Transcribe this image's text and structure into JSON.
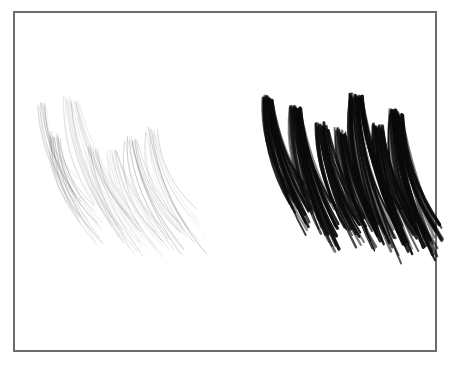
{
  "figure": {
    "title": "",
    "background_color": "#ffffff",
    "width": 452,
    "height": 365,
    "frame": {
      "label": "plot-border",
      "x": 14,
      "y": 12,
      "width": 422,
      "height": 339,
      "stroke_color": "#6b6b6b",
      "stroke_width": 1.4
    }
  },
  "chart_data": {
    "type": "scatter",
    "title": "",
    "subtitle": "",
    "xlabel": "",
    "ylabel": "",
    "xlim": [
      14,
      436
    ],
    "ylim": [
      12,
      351
    ],
    "grid": false,
    "legend": "none",
    "annotations": [],
    "tick_labels": {
      "x": [],
      "y": []
    },
    "series": [
      {
        "name": "left-cluster",
        "render": "stroke-bundles",
        "ink_color": "#5a5a5a",
        "ink_opacity": 0.55,
        "line_width": 0.55,
        "bounds": {
          "x0": 36,
          "y0": 98,
          "x1": 190,
          "y1": 286
        },
        "bundles": [
          {
            "id": "L1",
            "x": 42,
            "y": 106,
            "len": 108,
            "tilt": 20,
            "bow": 16,
            "count": 14,
            "spread": 9,
            "weight": 0.62,
            "fan": 7
          },
          {
            "id": "L2",
            "x": 55,
            "y": 136,
            "len": 112,
            "tilt": 23,
            "bow": 18,
            "count": 16,
            "spread": 11,
            "weight": 0.7,
            "fan": 9
          },
          {
            "id": "L3",
            "x": 71,
            "y": 100,
            "len": 150,
            "tilt": 22,
            "bow": 20,
            "count": 18,
            "spread": 14,
            "weight": 0.55,
            "fan": 11
          },
          {
            "id": "L4",
            "x": 92,
            "y": 150,
            "len": 118,
            "tilt": 25,
            "bow": 17,
            "count": 15,
            "spread": 12,
            "weight": 0.58,
            "fan": 9
          },
          {
            "id": "L5",
            "x": 112,
            "y": 152,
            "len": 120,
            "tilt": 26,
            "bow": 16,
            "count": 13,
            "spread": 11,
            "weight": 0.52,
            "fan": 8
          },
          {
            "id": "L6",
            "x": 131,
            "y": 140,
            "len": 128,
            "tilt": 24,
            "bow": 19,
            "count": 16,
            "spread": 12,
            "weight": 0.66,
            "fan": 9
          },
          {
            "id": "L7",
            "x": 151,
            "y": 131,
            "len": 134,
            "tilt": 23,
            "bow": 20,
            "count": 14,
            "spread": 11,
            "weight": 0.56,
            "fan": 8
          }
        ]
      },
      {
        "name": "right-cluster",
        "render": "stroke-bundles",
        "ink_color": "#0a0a0a",
        "ink_opacity": 0.92,
        "line_width": 1.5,
        "bounds": {
          "x0": 262,
          "y0": 94,
          "x1": 424,
          "y1": 272
        },
        "bundles": [
          {
            "id": "R1",
            "x": 268,
            "y": 100,
            "len": 128,
            "tilt": 17,
            "bow": 15,
            "count": 26,
            "spread": 10,
            "weight": 1.75,
            "fan": 7
          },
          {
            "id": "R2",
            "x": 296,
            "y": 110,
            "len": 142,
            "tilt": 15,
            "bow": 14,
            "count": 28,
            "spread": 11,
            "weight": 1.8,
            "fan": 8
          },
          {
            "id": "R3",
            "x": 322,
            "y": 126,
            "len": 124,
            "tilt": 18,
            "bow": 13,
            "count": 24,
            "spread": 12,
            "weight": 1.55,
            "fan": 8
          },
          {
            "id": "R4",
            "x": 341,
            "y": 132,
            "len": 118,
            "tilt": 17,
            "bow": 13,
            "count": 22,
            "spread": 11,
            "weight": 1.45,
            "fan": 7
          },
          {
            "id": "R5",
            "x": 356,
            "y": 98,
            "len": 158,
            "tilt": 14,
            "bow": 16,
            "count": 30,
            "spread": 13,
            "weight": 1.95,
            "fan": 9
          },
          {
            "id": "R6",
            "x": 378,
            "y": 128,
            "len": 130,
            "tilt": 16,
            "bow": 14,
            "count": 24,
            "spread": 11,
            "weight": 1.65,
            "fan": 8
          },
          {
            "id": "R7",
            "x": 396,
            "y": 114,
            "len": 150,
            "tilt": 15,
            "bow": 15,
            "count": 26,
            "spread": 12,
            "weight": 1.85,
            "fan": 8
          }
        ]
      }
    ]
  }
}
